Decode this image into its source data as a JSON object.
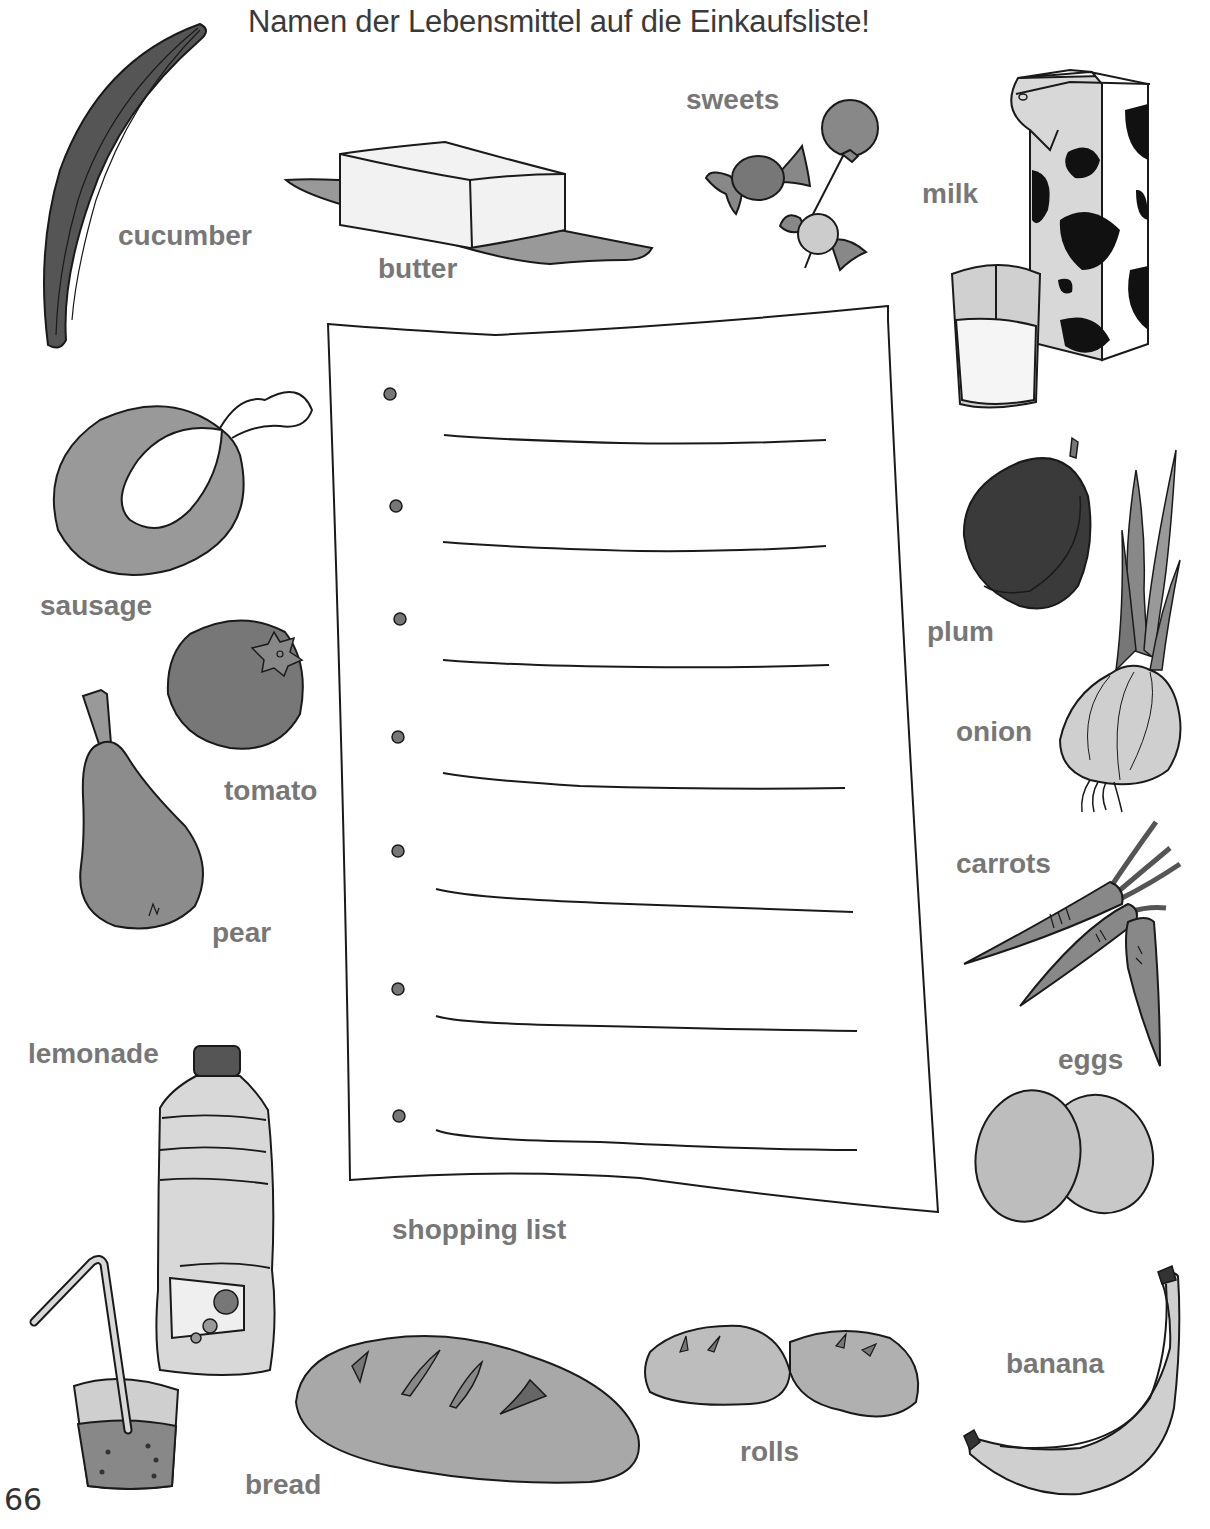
{
  "worksheet": {
    "title": "Namen der Lebensmittel auf die Einkaufsliste!",
    "page_number": "66",
    "shopping_list": {
      "label": "shopping list",
      "bullet_count": 7,
      "lines": [
        "",
        "",
        "",
        "",
        "",
        "",
        ""
      ]
    },
    "items": [
      {
        "id": "cucumber",
        "label": "cucumber"
      },
      {
        "id": "butter",
        "label": "butter"
      },
      {
        "id": "sweets",
        "label": "sweets"
      },
      {
        "id": "milk",
        "label": "milk"
      },
      {
        "id": "sausage",
        "label": "sausage"
      },
      {
        "id": "tomato",
        "label": "tomato"
      },
      {
        "id": "pear",
        "label": "pear"
      },
      {
        "id": "plum",
        "label": "plum"
      },
      {
        "id": "onion",
        "label": "onion"
      },
      {
        "id": "carrots",
        "label": "carrots"
      },
      {
        "id": "eggs",
        "label": "eggs"
      },
      {
        "id": "lemonade",
        "label": "lemonade"
      },
      {
        "id": "bread",
        "label": "bread"
      },
      {
        "id": "rolls",
        "label": "rolls"
      },
      {
        "id": "banana",
        "label": "banana"
      }
    ],
    "colors": {
      "title_text": "#3a3a3a",
      "label_text": "#777777",
      "outline": "#1a1a1a",
      "dark_fill": "#444444",
      "mid_fill": "#8a8a8a",
      "light_fill": "#b5b5b5",
      "pale_fill": "#dcdcdc"
    }
  }
}
